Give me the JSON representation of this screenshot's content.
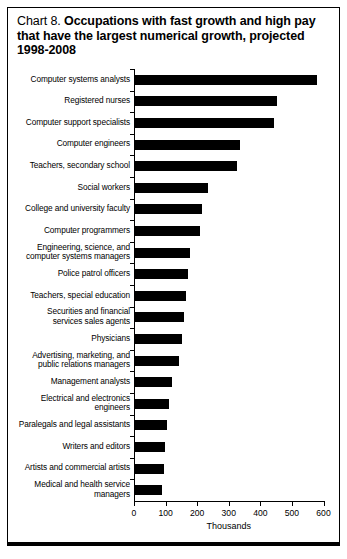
{
  "title": {
    "number": "Chart 8.",
    "headline": "Occupations with fast growth and high pay that have the largest numerical growth, projected 1998-2008"
  },
  "chart_data": {
    "type": "bar",
    "orientation": "horizontal",
    "title": "Chart 8. Occupations with fast growth and high pay that have the largest numerical growth, projected 1998-2008",
    "xlabel": "Thousands",
    "ylabel": "",
    "xlim": [
      0,
      600
    ],
    "xticks": [
      0,
      100,
      200,
      300,
      400,
      500,
      600
    ],
    "xtick_labels": [
      "0",
      "100",
      "200",
      "300",
      "400",
      "500",
      "600"
    ],
    "grid": false,
    "legend": false,
    "bar_color": "#000000",
    "categories": [
      "Computer systems analysts",
      "Registered nurses",
      "Computer support specialists",
      "Computer engineers",
      "Teachers, secondary school",
      "Social workers",
      "College and university faculty",
      "Computer programmers",
      "Engineering, science, and\ncomputer systems managers",
      "Police patrol officers",
      "Teachers, special education",
      "Securities and financial\nservices sales agents",
      "Physicians",
      "Advertising, marketing, and\npublic relations managers",
      "Management analysts",
      "Electrical and electronics\nengineers",
      "Paralegals and legal assistants",
      "Writers and editors",
      "Artists and commercial artists",
      "Medical and health service\nmanagers"
    ],
    "values": [
      577,
      451,
      439,
      332,
      322,
      232,
      212,
      205,
      174,
      168,
      161,
      155,
      148,
      138,
      118,
      108,
      100,
      96,
      92,
      84
    ]
  }
}
